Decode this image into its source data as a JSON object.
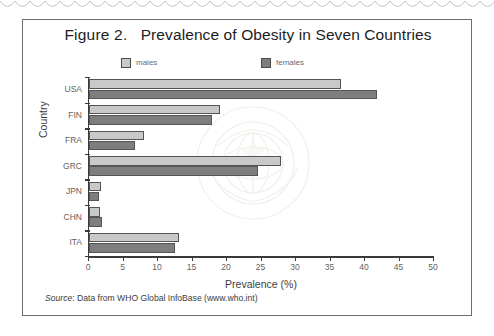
{
  "figure": {
    "title_number": "Figure 2.",
    "title_text": "Prevalence of Obesity in Seven Countries",
    "source_label": "Source",
    "source_text": ": Data from WHO Global InfoBase (www.who.int)",
    "watermark": "who-emblem-watermark"
  },
  "legend": {
    "males_label": "males",
    "females_label": "females"
  },
  "colors": {
    "males": "#c9c9c9",
    "females": "#7e7e7e",
    "axis": "#3a3a3a",
    "frame": "#6e6e6e"
  },
  "chart_data": {
    "type": "bar",
    "orientation": "horizontal",
    "xlabel": "Prevalence (%)",
    "ylabel": "Country",
    "xlim": [
      0,
      50
    ],
    "xticks": [
      0,
      5,
      10,
      15,
      20,
      25,
      30,
      35,
      40,
      45,
      50
    ],
    "grid": false,
    "legend_position": "top",
    "categories": [
      "USA",
      "FIN",
      "FRA",
      "GRC",
      "JPN",
      "CHN",
      "ITA"
    ],
    "series": [
      {
        "name": "males",
        "values": [
          36.5,
          19.0,
          7.9,
          27.8,
          1.8,
          1.6,
          13.0
        ]
      },
      {
        "name": "females",
        "values": [
          41.8,
          17.8,
          6.6,
          24.5,
          1.5,
          1.9,
          12.5
        ]
      }
    ],
    "annotations": [
      "Source: Data from WHO Global InfoBase (www.who.int)"
    ]
  }
}
